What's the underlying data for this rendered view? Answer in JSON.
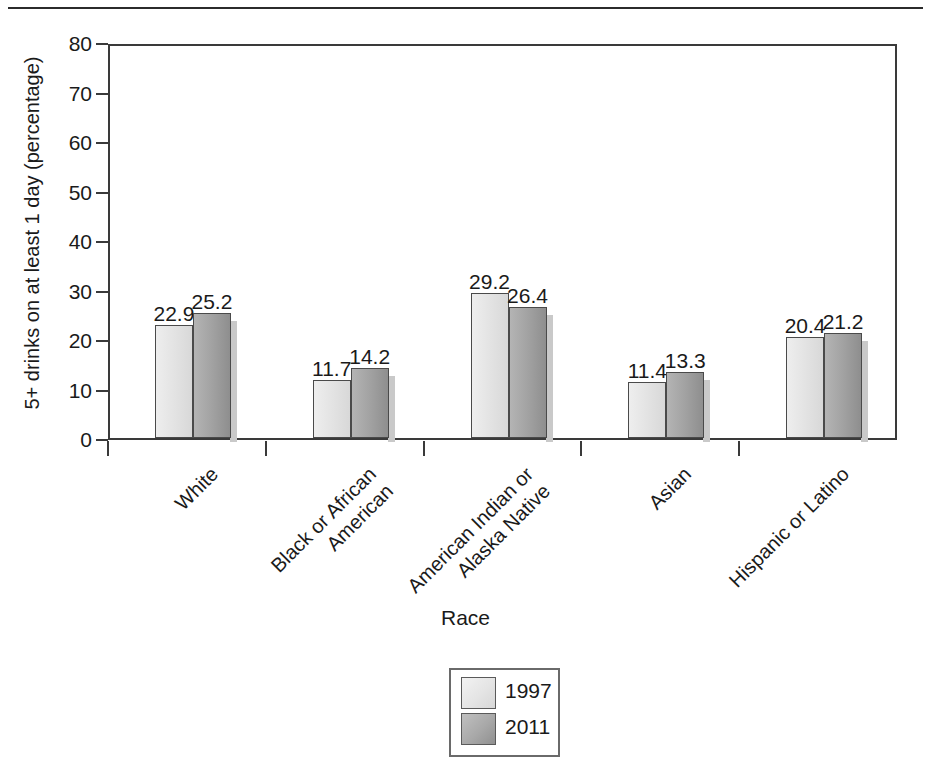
{
  "chart_data": {
    "type": "bar",
    "title": "",
    "xlabel": "Race",
    "ylabel": "5+ drinks on at least 1 day (percentage)",
    "ylim": [
      0,
      80
    ],
    "ytick_step": 10,
    "yticks": [
      "0",
      "10",
      "20",
      "30",
      "40",
      "50",
      "60",
      "70",
      "80"
    ],
    "grid": false,
    "legend_position": "bottom-center",
    "categories": [
      "White",
      "Black or African\nAmerican",
      "American Indian or\nAlaska Native",
      "Asian",
      "Hispanic or Latino"
    ],
    "category_lines": [
      [
        "White"
      ],
      [
        "Black or African",
        "American"
      ],
      [
        "American Indian or",
        "Alaska Native"
      ],
      [
        "Asian"
      ],
      [
        "Hispanic or Latino"
      ]
    ],
    "series": [
      {
        "name": "1997",
        "color": "#e3e3e3",
        "values": [
          22.9,
          11.7,
          29.2,
          11.4,
          20.4
        ]
      },
      {
        "name": "2011",
        "color": "#a0a0a0",
        "values": [
          25.2,
          14.2,
          26.4,
          13.3,
          21.2
        ]
      }
    ],
    "data_labels": [
      [
        "22.9",
        "25.2"
      ],
      [
        "11.7",
        "14.2"
      ],
      [
        "29.2",
        "26.4"
      ],
      [
        "11.4",
        "13.3"
      ],
      [
        "20.4",
        "21.2"
      ]
    ]
  },
  "legend": {
    "items": [
      {
        "label": "1997",
        "series": "s1997"
      },
      {
        "label": "2011",
        "series": "s2011"
      }
    ]
  },
  "axis": {
    "x_title": "Race",
    "y_title": "5+ drinks on at least 1 day (percentage)"
  },
  "colors": {
    "series_1997": "#e3e3e3",
    "series_2011": "#a0a0a0",
    "frame": "#3a3a3a",
    "text": "#1a1a1a"
  }
}
